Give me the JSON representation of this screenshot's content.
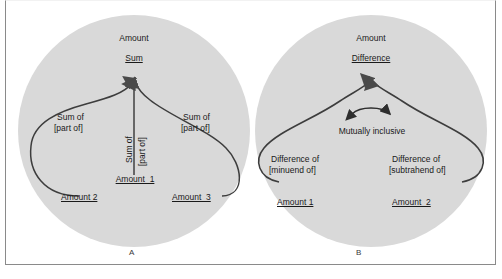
{
  "figure": {
    "caption_a": "A",
    "caption_b": "B",
    "circle_fill": "#d9d9d9",
    "line_color": "#3d3d3d",
    "frame_color": "#8a8a8a"
  },
  "panel_a": {
    "top_category": "Amount",
    "top_node": "Sum",
    "center_relation_line1": "Sum of",
    "center_relation_line2": "[part of]",
    "left_relation_line1": "Sum of",
    "left_relation_line2": "[part of]",
    "right_relation_line1": "Sum of",
    "right_relation_line2": "[part of]",
    "center_node": "Amount  1",
    "left_node": "Amount 2",
    "right_node": "Amount  3"
  },
  "panel_b": {
    "top_category": "Amount",
    "top_node": "Difference",
    "mutual_label": "Mutually inclusive",
    "left_relation_line1": "Difference of",
    "left_relation_line2": "[minuend of]",
    "right_relation_line1": "Difference of",
    "right_relation_line2": "[subtrahend of]",
    "left_node": "Amount 1",
    "right_node": "Amount  2"
  }
}
